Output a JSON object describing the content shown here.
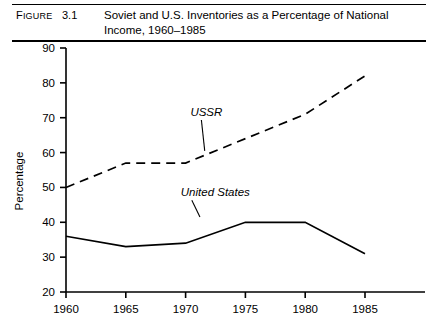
{
  "figure": {
    "label_prefix": "F",
    "label_rest": "IGURE",
    "number": "3.1",
    "title_line1": "Soviet and U.S. Inventories as a Percentage of National",
    "title_line2": "Income, 1960–1985"
  },
  "chart_data": {
    "type": "line",
    "title": "Soviet and U.S. Inventories as a Percentage of National Income, 1960–1985",
    "xlabel": "",
    "ylabel": "Percentage",
    "x": [
      1960,
      1965,
      1970,
      1975,
      1980,
      1985
    ],
    "xtick_labels": [
      "1960",
      "1965",
      "1970",
      "1975",
      "1980",
      "1985"
    ],
    "ytick_labels": [
      "20",
      "30",
      "40",
      "50",
      "60",
      "70",
      "80",
      "90"
    ],
    "yticks": [
      20,
      30,
      40,
      50,
      60,
      70,
      80,
      90
    ],
    "xlim": [
      1960,
      1987
    ],
    "ylim": [
      20,
      90
    ],
    "grid": false,
    "legend": "inline-annotations",
    "series": [
      {
        "name": "USSR",
        "style": "dashed",
        "color": "#000000",
        "values": [
          50,
          57,
          57,
          64,
          71,
          82
        ],
        "annotation": {
          "text": "USSR",
          "x": 1970.4,
          "y": 70.5,
          "leader_to_x": 1971.6,
          "leader_to_y": 60.5
        }
      },
      {
        "name": "United States",
        "style": "solid",
        "color": "#000000",
        "values": [
          36,
          33,
          34,
          40,
          40,
          31
        ],
        "annotation": {
          "text": "United States",
          "x": 1969.6,
          "y": 47.5,
          "leader_to_x": 1971.2,
          "leader_to_y": 41.5
        }
      }
    ]
  }
}
